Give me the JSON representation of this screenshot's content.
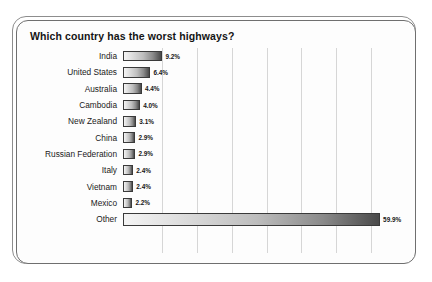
{
  "chart_data": {
    "type": "bar",
    "orientation": "horizontal",
    "title": "Which country has the worst highways?",
    "xlabel": "",
    "ylabel": "",
    "categories": [
      "India",
      "United States",
      "Australia",
      "Cambodia",
      "New Zealand",
      "China",
      "Russian Federation",
      "Italy",
      "Vietnam",
      "Mexico",
      "Other"
    ],
    "values": [
      9.2,
      6.4,
      4.4,
      4.0,
      3.1,
      2.9,
      2.9,
      2.4,
      2.4,
      2.2,
      59.9
    ],
    "value_labels": [
      "9.2%",
      "6.4%",
      "4.4%",
      "4.0%",
      "3.1%",
      "2.9%",
      "2.9%",
      "2.4%",
      "2.4%",
      "2.2%",
      "59.9%"
    ],
    "xlim": [
      0,
      65
    ],
    "grid": true,
    "gridline_count": 7,
    "legend": null,
    "colors": {
      "bar_gradient_start": "#f4f4f4",
      "bar_gradient_end": "#4a4a4a",
      "bar_border": "#3a3a3a",
      "gridline": "#d6d6d6",
      "title_text": "#141414",
      "label_text": "#1a1a1a",
      "frame_border": "#6f6f6f",
      "background": "#ffffff"
    }
  }
}
